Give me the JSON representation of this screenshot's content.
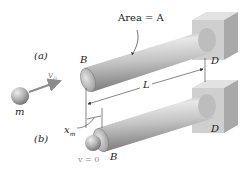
{
  "figure": {
    "labels": {
      "area": "Area = A",
      "part_a": "(a)",
      "part_b": "(b)",
      "end_b_top": "B",
      "end_d_top": "D",
      "end_b_bottom": "B",
      "end_d_bottom": "D",
      "length": "L",
      "initial_velocity": "v",
      "initial_velocity_sub": "0",
      "mass": "m",
      "max_deflection": "x",
      "max_deflection_sub": "m",
      "final_velocity": "v = 0"
    },
    "colors": {
      "rod_light": "#e6e6e6",
      "rod_mid": "#b4b4b4",
      "rod_dark": "#7d7d7d",
      "wall_front": "#cfcfcf",
      "wall_side": "#a9a9a9",
      "wall_top": "#e2e2e2",
      "sphere_light": "#e0e0e0",
      "sphere_dark": "#7a7a7a",
      "arrow": "#8c8c8c",
      "dimension_line": "#333333"
    }
  }
}
